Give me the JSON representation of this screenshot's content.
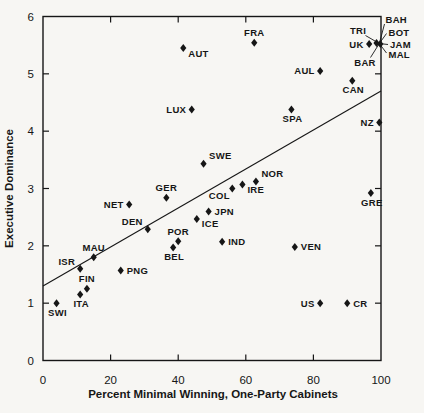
{
  "figure": {
    "background": "#f7f6f3",
    "ink": "#161616"
  },
  "chart_data": {
    "type": "scatter",
    "title": "",
    "xlabel": "Percent Minimal Winning, One-Party Cabinets",
    "ylabel": "Executive Dominance",
    "xlim": [
      0,
      100
    ],
    "ylim": [
      0,
      6
    ],
    "xticks": [
      0,
      20,
      40,
      60,
      80,
      100
    ],
    "yticks": [
      0,
      1,
      2,
      3,
      4,
      5,
      6
    ],
    "grid": false,
    "marker": "filled-diamond",
    "legend": "none",
    "points": [
      {
        "label": "SWI",
        "x": 4,
        "y": 1.0,
        "side": "below"
      },
      {
        "label": "ITA",
        "x": 11,
        "y": 1.15,
        "side": "below"
      },
      {
        "label": "FIN",
        "x": 13,
        "y": 1.25,
        "side": "above"
      },
      {
        "label": "ISR",
        "x": 11,
        "y": 1.6,
        "side": "above-left"
      },
      {
        "label": "MAU",
        "x": 15,
        "y": 1.8,
        "side": "above"
      },
      {
        "label": "PNG",
        "x": 23,
        "y": 1.57,
        "side": "right"
      },
      {
        "label": "NET",
        "x": 25.5,
        "y": 2.72,
        "side": "left"
      },
      {
        "label": "DEN",
        "x": 31,
        "y": 2.29,
        "side": "above-left"
      },
      {
        "label": "GER",
        "x": 36.5,
        "y": 2.84,
        "side": "above"
      },
      {
        "label": "POR",
        "x": 40,
        "y": 2.08,
        "side": "above"
      },
      {
        "label": "BEL",
        "x": 38.5,
        "y": 1.97,
        "side": "below"
      },
      {
        "label": "ICE",
        "x": 45.5,
        "y": 2.47,
        "side": "below-right"
      },
      {
        "label": "JPN",
        "x": 49,
        "y": 2.6,
        "side": "right"
      },
      {
        "label": "IND",
        "x": 53,
        "y": 2.07,
        "side": "right"
      },
      {
        "label": "SWE",
        "x": 47.5,
        "y": 3.43,
        "side": "above-right"
      },
      {
        "label": "COL",
        "x": 56,
        "y": 3.0,
        "side": "below-left"
      },
      {
        "label": "IRE",
        "x": 59,
        "y": 3.07,
        "side": "below-right"
      },
      {
        "label": "NOR",
        "x": 63,
        "y": 3.12,
        "side": "above-right"
      },
      {
        "label": "LUX",
        "x": 44,
        "y": 4.38,
        "side": "left"
      },
      {
        "label": "AUT",
        "x": 41.5,
        "y": 5.45,
        "side": "below-right"
      },
      {
        "label": "FRA",
        "x": 62.5,
        "y": 5.54,
        "side": "above"
      },
      {
        "label": "SPA",
        "x": 73.5,
        "y": 4.38,
        "side": "below"
      },
      {
        "label": "AUL",
        "x": 82,
        "y": 5.05,
        "side": "left"
      },
      {
        "label": "CAN",
        "x": 91.5,
        "y": 4.88,
        "side": "below"
      },
      {
        "label": "NZ",
        "x": 99.5,
        "y": 4.15,
        "side": "left"
      },
      {
        "label": "GRE",
        "x": 97,
        "y": 2.92,
        "side": "below"
      },
      {
        "label": "VEN",
        "x": 74.5,
        "y": 1.98,
        "side": "right"
      },
      {
        "label": "US",
        "x": 82,
        "y": 1.0,
        "side": "left"
      },
      {
        "label": "CR",
        "x": 90,
        "y": 1.0,
        "side": "right"
      },
      {
        "label": "UK",
        "x": 96.5,
        "y": 5.52,
        "side": "left"
      }
    ],
    "cluster": {
      "x": 99.8,
      "y": 5.52,
      "note": "overlapping points at top-right labeled via callout lines",
      "callouts": [
        {
          "label": "TRI",
          "text_x": 358,
          "text_y": 33.5,
          "anchor": "middle",
          "line_to_x": 365.5,
          "line_to_y": 35.5
        },
        {
          "label": "BAH",
          "text_x": 385.5,
          "text_y": 23,
          "anchor": "start",
          "line_to_x": 384.5,
          "line_to_y": 24
        },
        {
          "label": "BOT",
          "text_x": 388.5,
          "text_y": 35.5,
          "anchor": "start",
          "line_to_x": 386.5,
          "line_to_y": 33.5
        },
        {
          "label": "JAM",
          "text_x": 390,
          "text_y": 47.5,
          "anchor": "start",
          "line_to_x": 388,
          "line_to_y": 44.5
        },
        {
          "label": "MAL",
          "text_x": 388.5,
          "text_y": 57.5,
          "anchor": "start",
          "line_to_x": 386.5,
          "line_to_y": 53
        },
        {
          "label": "BAR",
          "text_x": 365,
          "text_y": 65.5,
          "anchor": "middle",
          "line_to_x": 370.5,
          "line_to_y": 57.5
        }
      ]
    },
    "trend_line": {
      "x1": 0,
      "y1": 1.3,
      "x2": 100,
      "y2": 4.7
    }
  }
}
